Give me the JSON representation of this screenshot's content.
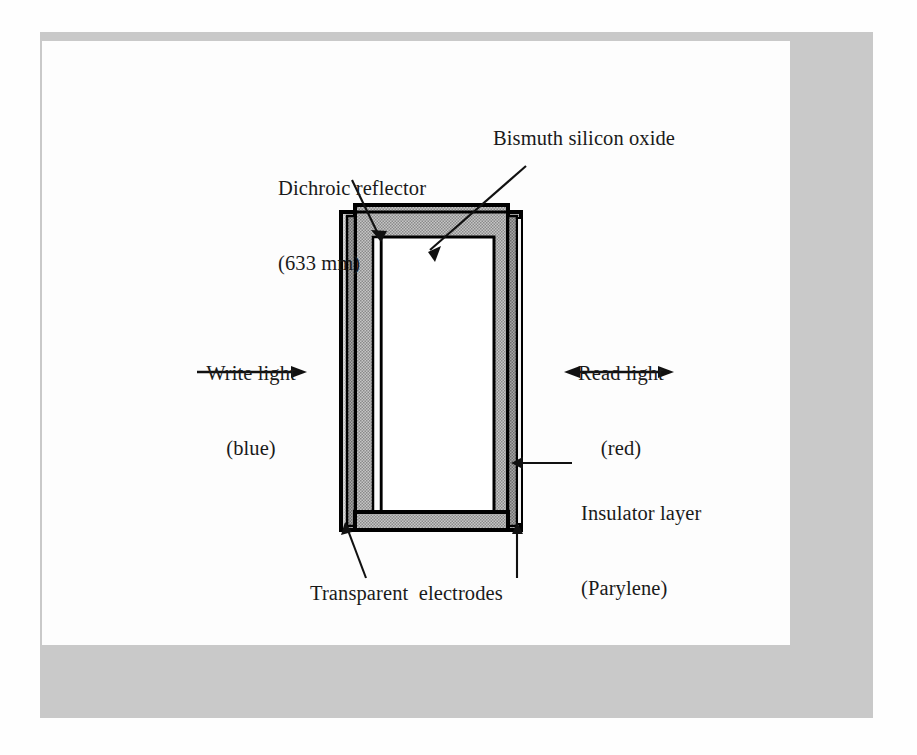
{
  "figure": {
    "type": "technical-cross-section-diagram",
    "background_color": "#fdfdfd",
    "mat_frame_color": "#c9c9c9",
    "line_color": "#000000"
  },
  "labels": {
    "dichroic_reflector": {
      "line1": "Dichroic reflector",
      "line2": "(633 mm)"
    },
    "bismuth_silicon_oxide": "Bismuth silicon oxide",
    "write_light": {
      "line1": "Write light",
      "line2": "(blue)"
    },
    "read_light": {
      "line1": "Read light",
      "line2": "(red)"
    },
    "insulator_layer": {
      "line1": "Insulator layer",
      "line2": "(Parylene)"
    },
    "transparent_electrodes": "Transparent  electrodes"
  },
  "arrows": {
    "write_light_arrow": {
      "direction": "right",
      "heads": 1,
      "x1": 197,
      "x2": 305,
      "y": 372
    },
    "read_light_arrow": {
      "direction": "bidirectional",
      "heads": 2,
      "x1": 565,
      "x2": 673,
      "y": 372
    }
  },
  "leaders": [
    {
      "name": "dichroic-reflector-leader",
      "from": [
        352,
        180
      ],
      "to": [
        381,
        237
      ]
    },
    {
      "name": "bismuth-silicon-oxide-leader",
      "from": [
        524,
        166
      ],
      "to": [
        428,
        248
      ]
    },
    {
      "name": "insulator-layer-leader",
      "from": [
        570,
        463
      ],
      "to": [
        512,
        463
      ]
    },
    {
      "name": "transparent-electrode-left-leader",
      "from": [
        365,
        577
      ],
      "to": [
        345,
        523
      ]
    },
    {
      "name": "transparent-electrode-right-leader",
      "from": [
        517,
        577
      ],
      "to": [
        517,
        523
      ]
    }
  ],
  "device": {
    "name": "spatial-light-modulator-stack",
    "outer_frame": {
      "x": 340,
      "y": 212,
      "width": 180,
      "height": 318,
      "fill": "#cfcfcf"
    },
    "inner_layer": {
      "x": 355,
      "y": 205,
      "width": 165,
      "height": 325,
      "fill": "#8f8f8f"
    },
    "core": {
      "x": 381,
      "y": 237,
      "width": 113,
      "height": 277,
      "fill": "#ffffff"
    },
    "layer_colors": {
      "light_gray": "#cfcfcf",
      "mid_gray": "#9a9a9a",
      "dark_gray": "#7c7c7c",
      "white": "#ffffff",
      "black": "#000000"
    }
  }
}
